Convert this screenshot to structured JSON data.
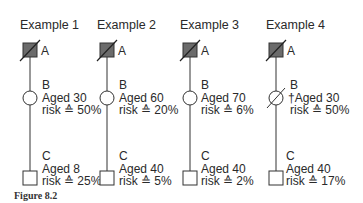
{
  "examples": [
    {
      "title": "Example 1",
      "a": {
        "label": "A"
      },
      "b": {
        "label": "B",
        "age": "Aged 30",
        "risk": "risk ≙ 50%",
        "deceased": false
      },
      "c": {
        "label": "C",
        "age": "Aged 8",
        "risk": "risk ≙ 25%"
      }
    },
    {
      "title": "Example 2",
      "a": {
        "label": "A"
      },
      "b": {
        "label": "B",
        "age": "Aged 60",
        "risk": "risk ≙ 20%",
        "deceased": false
      },
      "c": {
        "label": "C",
        "age": "Aged 40",
        "risk": "risk ≙ 5%"
      }
    },
    {
      "title": "Example 3",
      "a": {
        "label": "A"
      },
      "b": {
        "label": "B",
        "age": "Aged 70",
        "risk": "risk ≙ 6%",
        "deceased": false
      },
      "c": {
        "label": "C",
        "age": "Aged 40",
        "risk": "risk ≙ 2%"
      }
    },
    {
      "title": "Example 4",
      "a": {
        "label": "A"
      },
      "b": {
        "label": "B",
        "age": "†Aged 30",
        "risk": "risk ≙ 50%",
        "deceased": true
      },
      "c": {
        "label": "C",
        "age": "Aged 40",
        "risk": "risk ≙ 17%"
      }
    }
  ],
  "caption": "Figure 8.2",
  "colors": {
    "affected_fill": "#6b6b6b",
    "line": "#333333"
  }
}
